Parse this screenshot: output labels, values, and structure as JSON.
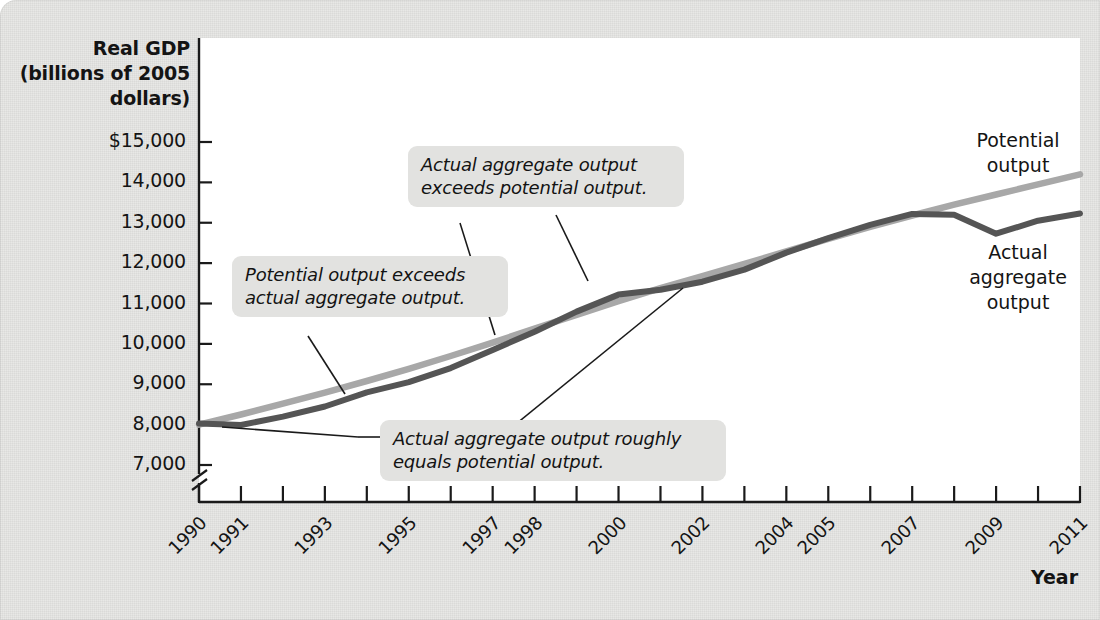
{
  "figure": {
    "background_color": "#e8e8e6",
    "plot_background_color": "#ffffff"
  },
  "axes": {
    "y_title": "Real GDP\n(billions of\n2005 dollars)",
    "x_title": "Year",
    "y_ticks": [
      "$15,000",
      "14,000",
      "13,000",
      "12,000",
      "11,000",
      "10,000",
      "9,000",
      "8,000",
      "7,000"
    ],
    "y_tick_values": [
      15000,
      14000,
      13000,
      12000,
      11000,
      10000,
      9000,
      8000,
      7000
    ],
    "x_ticks": [
      "1990",
      "1991",
      "",
      "1993",
      "",
      "1995",
      "",
      "1997",
      "1998",
      "",
      "2000",
      "",
      "2002",
      "",
      "2004",
      "2005",
      "",
      "2007",
      "",
      "2009",
      "",
      "2011"
    ],
    "axis_break": true
  },
  "series_labels": {
    "potential": "Potential\noutput",
    "actual": "Actual\naggregate\noutput"
  },
  "annotations": [
    {
      "id": "potential-exceeds-actual",
      "text": "Potential output exceeds\nactual aggregate output."
    },
    {
      "id": "actual-exceeds-potential",
      "text": "Actual aggregate output\nexceeds potential output."
    },
    {
      "id": "actual-equals-potential",
      "text": "Actual aggregate output roughly\nequals potential output."
    }
  ],
  "chart_data": {
    "type": "line",
    "title": "",
    "xlabel": "Year",
    "ylabel": "Real GDP (billions of 2005 dollars)",
    "xlim": [
      1990,
      2011
    ],
    "ylim": [
      7000,
      15000
    ],
    "grid": false,
    "legend": "inline-labels-right",
    "colors": {
      "potential_output": "#a8a8a8",
      "actual_aggregate_output": "#555555"
    },
    "x": [
      1990,
      1991,
      1992,
      1993,
      1994,
      1995,
      1996,
      1997,
      1998,
      1999,
      2000,
      2001,
      2002,
      2003,
      2004,
      2005,
      2006,
      2007,
      2008,
      2009,
      2010,
      2011
    ],
    "series": [
      {
        "name": "Potential output",
        "color": "#a8a8a8",
        "values": [
          8000,
          8250,
          8520,
          8790,
          9080,
          9380,
          9700,
          10030,
          10380,
          10720,
          11060,
          11380,
          11680,
          11980,
          12290,
          12600,
          12900,
          13180,
          13450,
          13700,
          13950,
          14200
        ]
      },
      {
        "name": "Actual aggregate output",
        "color": "#555555",
        "values": [
          8030,
          7990,
          8200,
          8450,
          8800,
          9050,
          9400,
          9850,
          10300,
          10800,
          11220,
          11340,
          11540,
          11840,
          12260,
          12620,
          12950,
          13220,
          13200,
          12730,
          13050,
          13230
        ]
      }
    ]
  }
}
